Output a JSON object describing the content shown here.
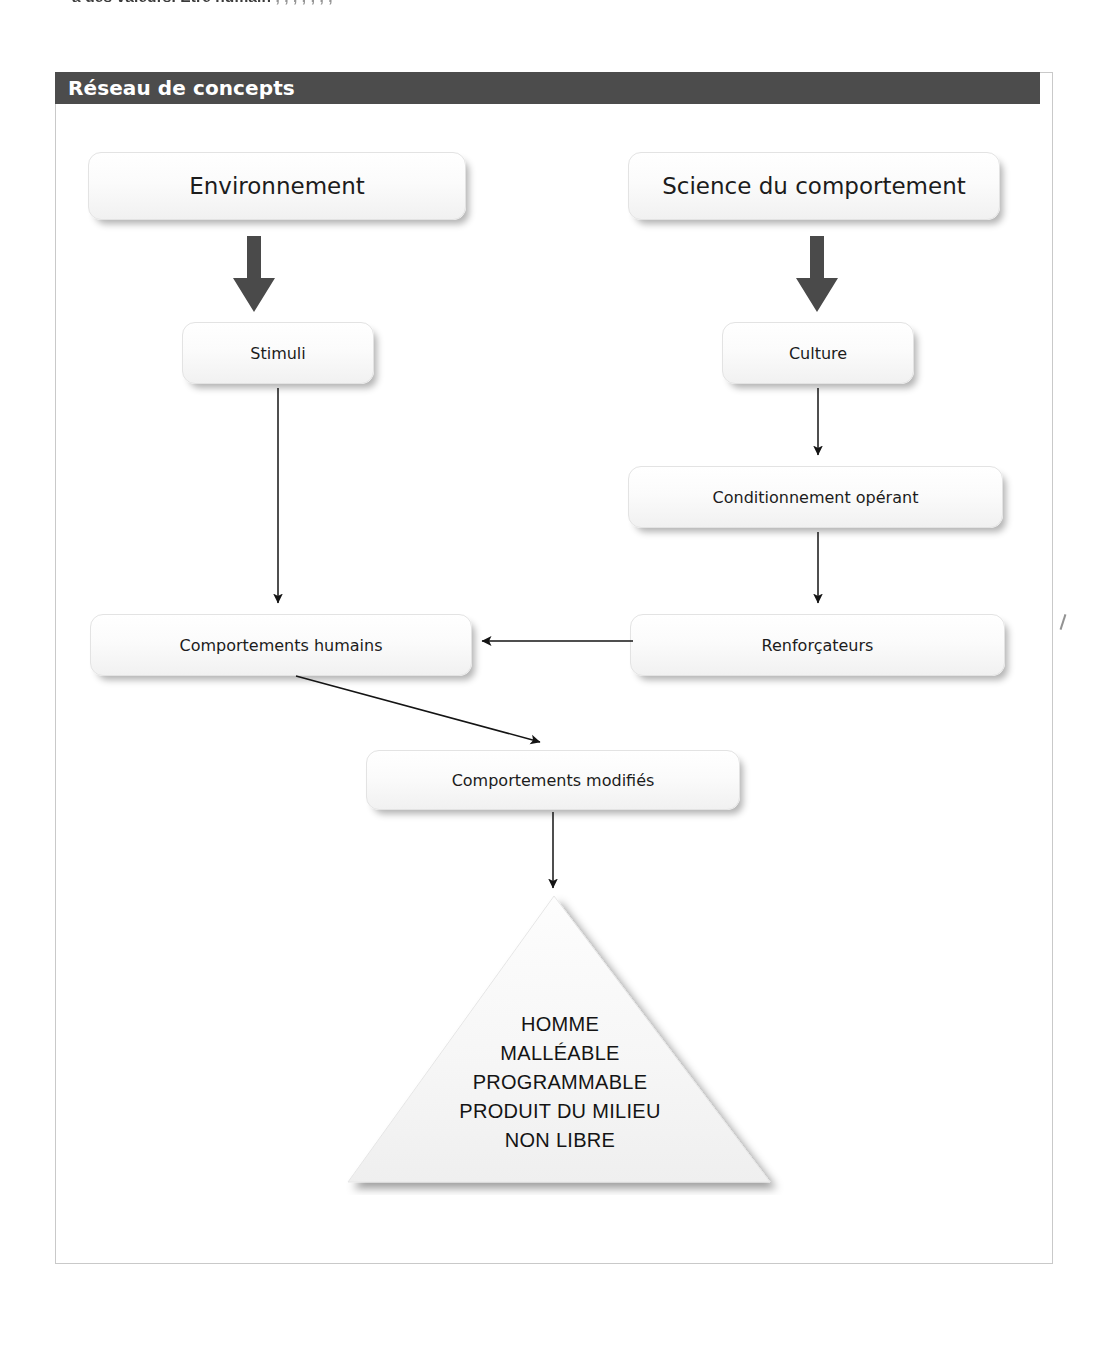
{
  "page": {
    "cutoff_running_text": "à des valeurs. Être humain",
    "cutoff_running_text_faded": " , , , , , , ,"
  },
  "section": {
    "header_title": "Réseau de concepts"
  },
  "diagram": {
    "type": "concept-map",
    "nodes": [
      {
        "id": "environnement",
        "label": "Environnement"
      },
      {
        "id": "science",
        "label": "Science du comportement"
      },
      {
        "id": "stimuli",
        "label": "Stimuli"
      },
      {
        "id": "culture",
        "label": "Culture"
      },
      {
        "id": "conditionnement",
        "label": "Conditionnement opérant"
      },
      {
        "id": "renforcateurs",
        "label": "Renforçateurs"
      },
      {
        "id": "comportements_humains",
        "label": "Comportements humains"
      },
      {
        "id": "comportements_modifies",
        "label": "Comportements modifiés"
      }
    ],
    "edges": [
      {
        "from": "environnement",
        "to": "stimuli",
        "style": "thick"
      },
      {
        "from": "science",
        "to": "culture",
        "style": "thick"
      },
      {
        "from": "stimuli",
        "to": "comportements_humains",
        "style": "thin"
      },
      {
        "from": "culture",
        "to": "conditionnement",
        "style": "thin"
      },
      {
        "from": "conditionnement",
        "to": "renforcateurs",
        "style": "thin"
      },
      {
        "from": "renforcateurs",
        "to": "comportements_humains",
        "style": "thin"
      },
      {
        "from": "comportements_humains",
        "to": "comportements_modifies",
        "style": "thin"
      },
      {
        "from": "comportements_modifies",
        "to": "conclusion-triangle",
        "style": "thin"
      }
    ],
    "conclusion": {
      "shape": "triangle",
      "lines": [
        "HOMME",
        "MALLÉABLE",
        "PROGRAMMABLE",
        "PRODUIT DU MILIEU",
        "NON LIBRE"
      ]
    }
  },
  "colors": {
    "header_bar": "#4c4c4c",
    "header_text": "#ffffff",
    "frame_border": "#c9c9c9",
    "node_fill": "#fafafa",
    "thick_arrow": "#4a4a4a",
    "thin_arrow": "#1a1a1a",
    "triangle_fill": "#f4f4f4"
  }
}
